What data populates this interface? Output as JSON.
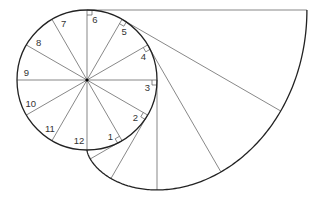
{
  "diagram": {
    "type": "involute-of-circle",
    "circle": {
      "cx": 87,
      "cy": 80,
      "r": 70
    },
    "divisions": 12,
    "point_labels": [
      "1",
      "2",
      "3",
      "4",
      "5",
      "6",
      "7",
      "8",
      "9",
      "10",
      "11",
      "12"
    ],
    "stroke_color": "#333333",
    "thin_line_color": "#555555"
  }
}
